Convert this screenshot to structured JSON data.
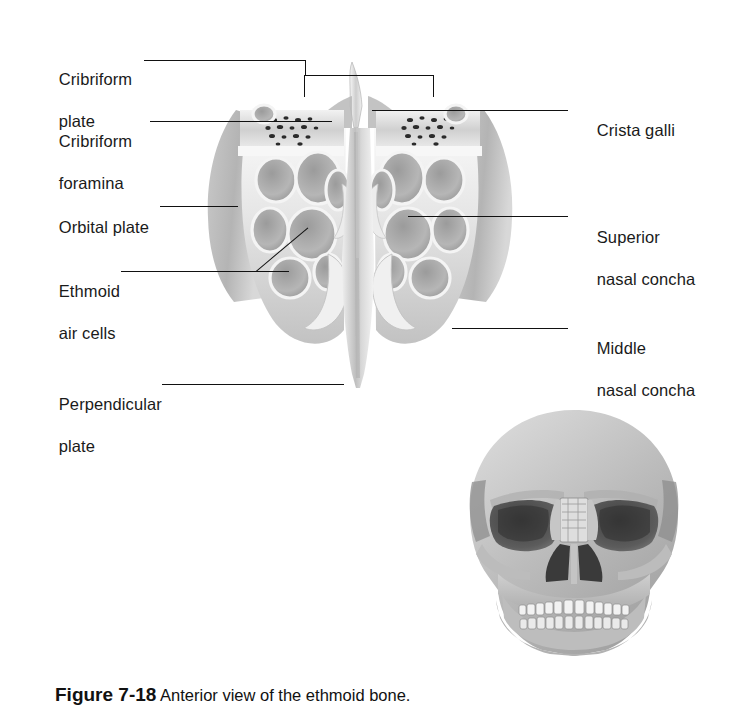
{
  "figure": {
    "background": "#ffffff",
    "ink": "#1a1a1a",
    "caption": {
      "number": "Figure 7-18",
      "text": "  Anterior view of the ethmoid bone.",
      "clipped": true
    }
  },
  "labels": {
    "left": [
      {
        "id": "cribriform-plate",
        "line1": "Cribriform",
        "line2": "plate"
      },
      {
        "id": "cribriform-foramina",
        "line1": "Cribriform",
        "line2": "foramina"
      },
      {
        "id": "orbital-plate",
        "line1": "Orbital plate",
        "line2": ""
      },
      {
        "id": "ethmoid-air-cells",
        "line1": "Ethmoid",
        "line2": "air cells"
      },
      {
        "id": "perpendicular-plate",
        "line1": "Perpendicular",
        "line2": "plate"
      }
    ],
    "right": [
      {
        "id": "crista-galli",
        "line1": "Crista galli",
        "line2": ""
      },
      {
        "id": "superior-nasal-concha",
        "line1": "Superior",
        "line2": "nasal concha"
      },
      {
        "id": "middle-nasal-concha",
        "line1": "Middle",
        "line2": "nasal concha"
      }
    ]
  },
  "inset": {
    "id": "skull-anterior-inset",
    "description": "Anterior view of the skull showing the ethmoid in situ"
  }
}
